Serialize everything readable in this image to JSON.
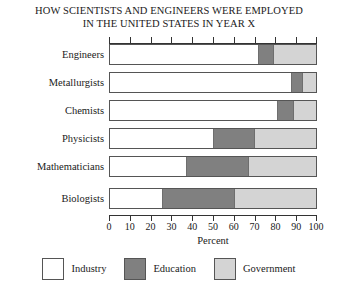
{
  "chart_data": {
    "type": "bar",
    "orientation": "horizontal",
    "stacked": true,
    "title": "HOW SCIENTISTS AND ENGINEERS WERE EMPLOYED IN THE UNITED STATES IN YEAR X",
    "title_lines": [
      "HOW SCIENTISTS AND ENGINEERS WERE EMPLOYED",
      "IN THE UNITED STATES IN YEAR X"
    ],
    "categories": [
      "Engineers",
      "Metallurgists",
      "Chemists",
      "Physicists",
      "Mathematicians",
      "Biologists"
    ],
    "series": [
      {
        "name": "Industry",
        "color": "#ffffff",
        "values": [
          72,
          88,
          81,
          50,
          37,
          25
        ]
      },
      {
        "name": "Education",
        "color": "#808080",
        "values": [
          7,
          5,
          8,
          20,
          30,
          35
        ]
      },
      {
        "name": "Government",
        "color": "#d4d4d4",
        "values": [
          21,
          7,
          11,
          30,
          33,
          40
        ]
      }
    ],
    "xlabel": "Percent",
    "ylabel": "",
    "xlim": [
      0,
      100
    ],
    "xticks": [
      0,
      10,
      20,
      30,
      40,
      50,
      60,
      70,
      80,
      90,
      100
    ],
    "xtick_labels": [
      "0",
      "10",
      "20",
      "30",
      "40",
      "50",
      "60",
      "70",
      "80",
      "90",
      "100"
    ],
    "grid": false,
    "legend_position": "bottom",
    "legend": [
      "Industry",
      "Education",
      "Government"
    ]
  }
}
